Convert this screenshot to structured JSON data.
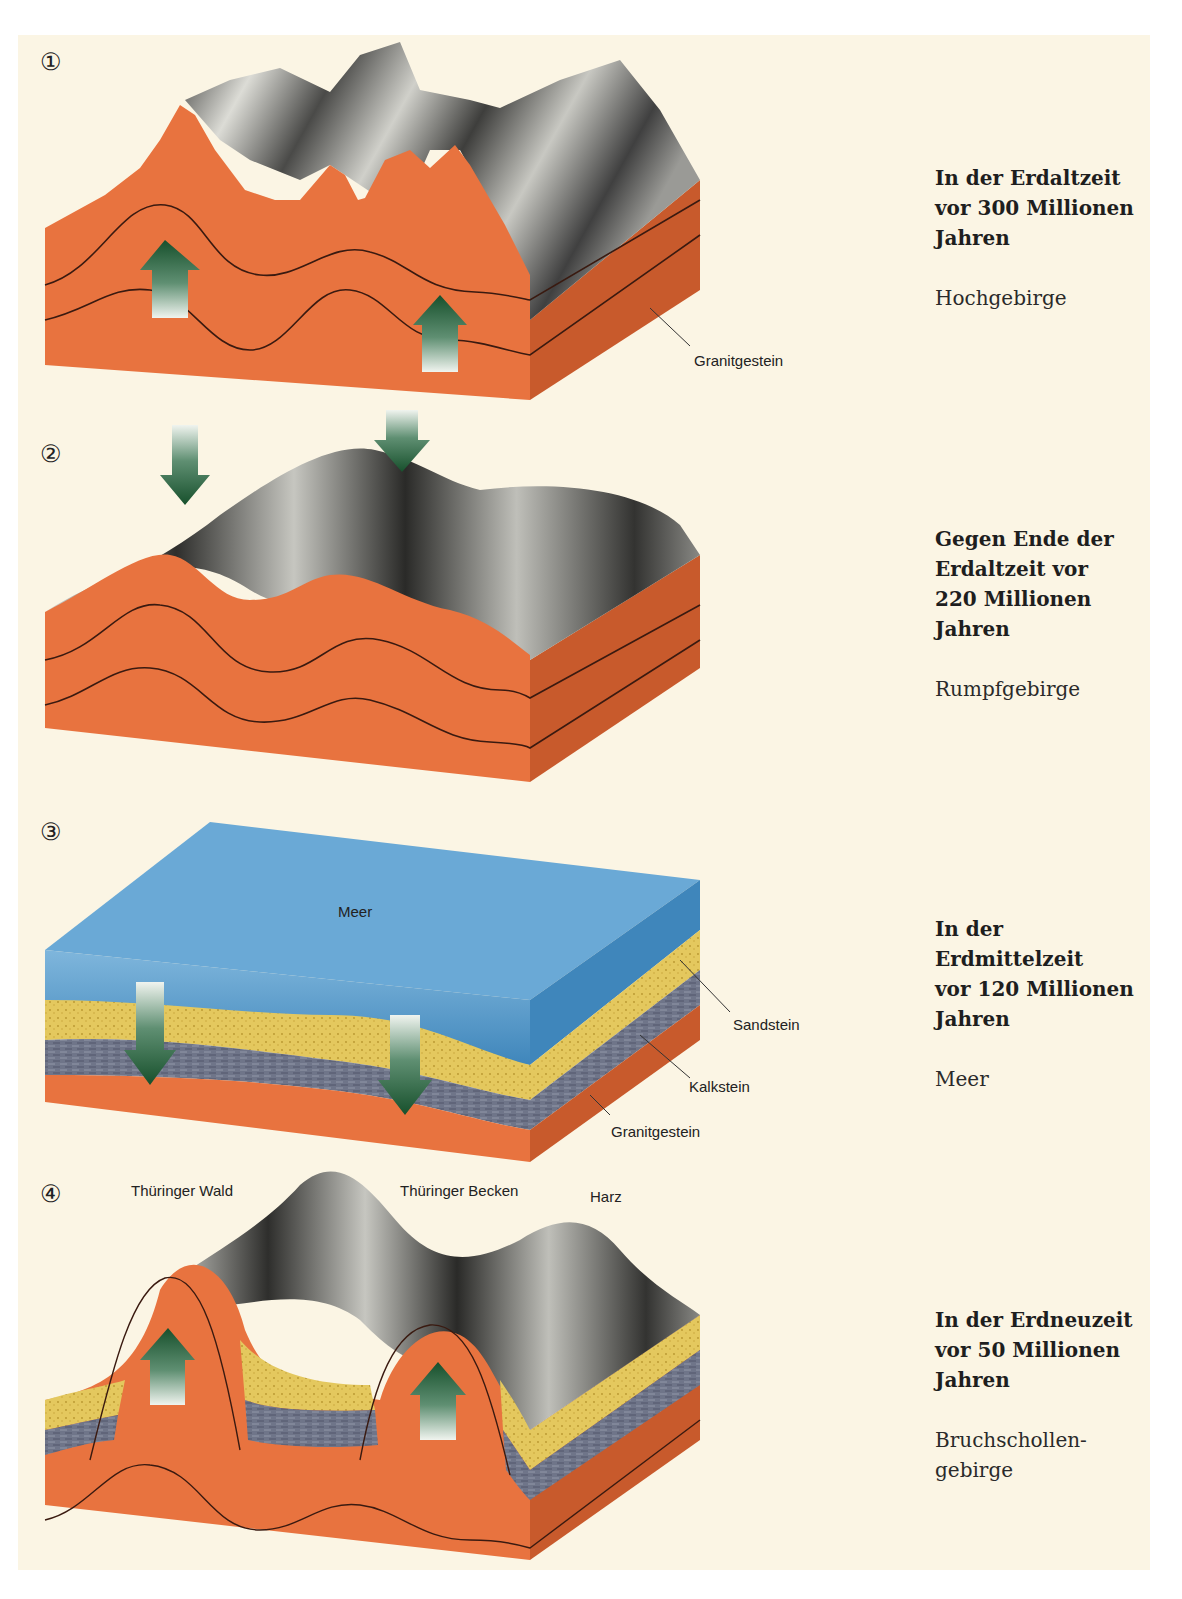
{
  "colors": {
    "background": "#fbf5e4",
    "granite": "#e5703e",
    "granite_side": "#c85a2c",
    "sandstone": "#e3c65a",
    "limestone": "#6e7488",
    "sea_top": "#6aa9d6",
    "sea_front": "#4f93c4",
    "arrow_green": "#1f5a34",
    "terrain_gray": "#5a5a58"
  },
  "stages": [
    {
      "number": "①",
      "title": "In der Erdaltzeit\nvor 300 Millionen\nJahren",
      "subtitle": "Hochgebirge",
      "labels": [
        "Granitgestein"
      ],
      "arrows": "up"
    },
    {
      "number": "②",
      "title": "Gegen Ende der\nErdaltzeit vor\n220 Millionen\nJahren",
      "subtitle": "Rumpfgebirge",
      "labels": [],
      "arrows": "down"
    },
    {
      "number": "③",
      "title": "In der\nErdmittelzeit\nvor 120 Millionen\nJahren",
      "subtitle": "Meer",
      "labels": [
        "Meer",
        "Sandstein",
        "Kalkstein",
        "Granitgestein"
      ],
      "arrows": "down"
    },
    {
      "number": "④",
      "title": "In der Erdneuzeit\nvor 50 Millionen\nJahren",
      "subtitle": "Bruchschollen-\ngebirge",
      "labels": [
        "Thüringer Wald",
        "Thüringer Becken",
        "Harz"
      ],
      "arrows": "up"
    }
  ]
}
